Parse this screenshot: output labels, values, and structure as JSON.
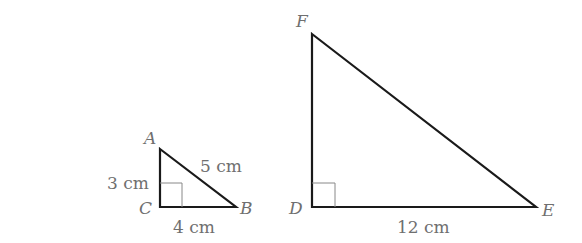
{
  "triangles": [
    {
      "name": "ABC",
      "vertices": {
        "A": "A",
        "B": "B",
        "C": "C"
      },
      "right_angle_at": "C",
      "sides": {
        "AC": "3 cm",
        "CB": "4 cm",
        "AB": "5 cm"
      }
    },
    {
      "name": "DEF",
      "vertices": {
        "D": "D",
        "E": "E",
        "F": "F"
      },
      "right_angle_at": "D",
      "sides": {
        "DE": "12 cm"
      }
    }
  ],
  "colors": {
    "stroke": "#1a1a1a",
    "label": "#6f6f6f",
    "right_angle_mark": "#888888"
  }
}
